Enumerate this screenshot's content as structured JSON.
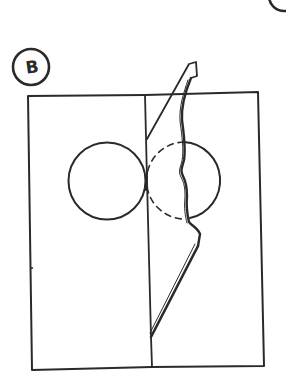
{
  "figure": {
    "panel_label": "B",
    "corner_label": "",
    "colors": {
      "ink": "#2a2a2a",
      "background": "#ffffff"
    },
    "elements": [
      {
        "name": "panel-label-circle",
        "label": "B"
      },
      {
        "name": "outer-rectangle"
      },
      {
        "name": "fold-line"
      },
      {
        "name": "left-circle"
      },
      {
        "name": "right-circle-visible-arc"
      },
      {
        "name": "right-circle-hidden-arc",
        "style": "dashed"
      },
      {
        "name": "cut-flap"
      }
    ]
  }
}
